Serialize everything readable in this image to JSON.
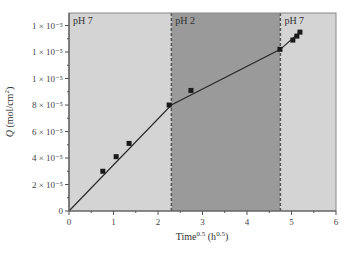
{
  "chart_data": {
    "type": "line",
    "title": "",
    "xlabel": "Time^0.5 (h^0.5)",
    "xlabel_parts": {
      "base": "Time",
      "sup1": "0.5",
      "mid": " (h",
      "sup2": "0.5",
      "end": ")"
    },
    "ylabel": "Q (mol/cm^2)",
    "ylabel_parts": {
      "italic": "Q",
      "rest": " (mol/cm",
      "sup": "2",
      "end": ")"
    },
    "xlim": [
      0,
      6
    ],
    "ylim": [
      0,
      15
    ],
    "grid": false,
    "legend": null,
    "x_ticks": [
      {
        "value": 0,
        "label": "0"
      },
      {
        "value": 1,
        "label": "1"
      },
      {
        "value": 2,
        "label": "2"
      },
      {
        "value": 3,
        "label": "3"
      },
      {
        "value": 4,
        "label": "4"
      },
      {
        "value": 5,
        "label": "5"
      },
      {
        "value": 6,
        "label": "6"
      }
    ],
    "y_ticks": [
      {
        "value": 0,
        "label": "0"
      },
      {
        "value": 2,
        "label": "2 × 10⁻⁵"
      },
      {
        "value": 4,
        "label": "4 × 10⁻⁵"
      },
      {
        "value": 6,
        "label": "6 × 10⁻⁵"
      },
      {
        "value": 8,
        "label": "8 × 10⁻⁵"
      },
      {
        "value": 10,
        "label": "1 × 10⁻⁵"
      },
      {
        "value": 12,
        "label": "1 × 10⁻⁵"
      },
      {
        "value": 14,
        "label": "1 × 10⁻⁵"
      }
    ],
    "y_units_note": "values in units of 10^-5 mol/cm^2",
    "regions": [
      {
        "label": "pH 7",
        "x_start": 0,
        "x_end": 2.3,
        "color": "#d4d4d4"
      },
      {
        "label": "pH 2",
        "x_start": 2.3,
        "x_end": 4.75,
        "color": "#9a9a9a"
      },
      {
        "label": "pH 7",
        "x_start": 4.75,
        "x_end": 6,
        "color": "#d4d4d4"
      }
    ],
    "series": [
      {
        "name": "measured",
        "type": "scatter",
        "marker": "square",
        "x": [
          0.76,
          1.06,
          1.35,
          2.25,
          2.74,
          4.74,
          5.03,
          5.12,
          5.19
        ],
        "y": [
          3.0,
          4.1,
          5.1,
          8.0,
          9.1,
          12.2,
          12.9,
          13.2,
          13.5
        ]
      },
      {
        "name": "fit",
        "type": "line",
        "x": [
          0,
          2.3,
          4.75,
          5.22
        ],
        "y": [
          0,
          8.0,
          12.2,
          13.6
        ]
      }
    ],
    "colors": {
      "axis": "#555555",
      "line": "#2a2a2a",
      "marker": "#1a1a1a",
      "region_ph7": "#d4d4d4",
      "region_ph2": "#9a9a9a",
      "boundary": "#555555"
    }
  }
}
